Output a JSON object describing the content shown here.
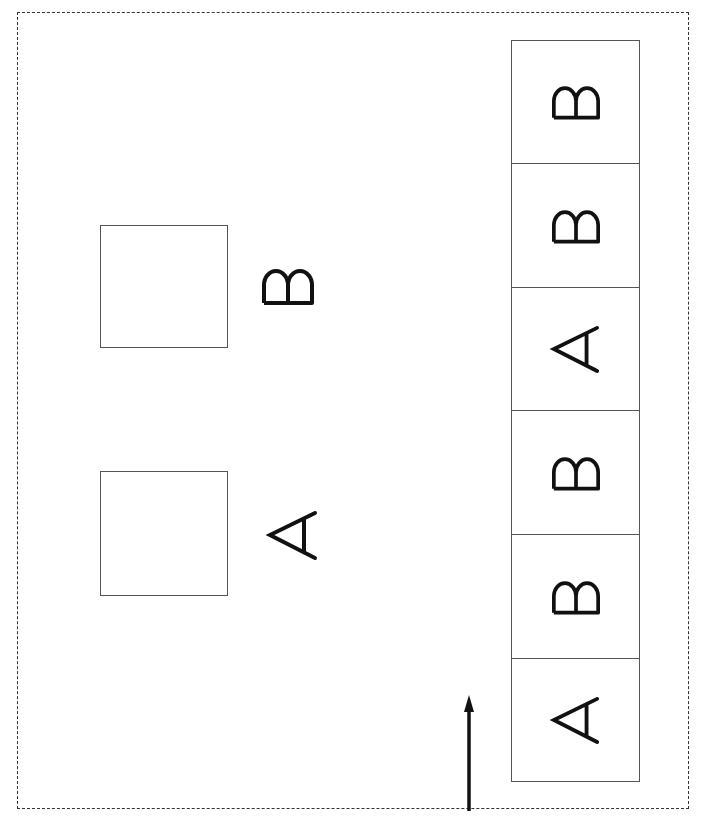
{
  "diagram": {
    "reference_items": [
      {
        "box": "empty",
        "label": "B"
      },
      {
        "box": "empty",
        "label": "A"
      }
    ],
    "stack": {
      "order_top_to_bottom": [
        "B",
        "B",
        "A",
        "B",
        "B",
        "A"
      ],
      "cells": [
        {
          "label": "B"
        },
        {
          "label": "B"
        },
        {
          "label": "A"
        },
        {
          "label": "B"
        },
        {
          "label": "B"
        },
        {
          "label": "A"
        }
      ]
    },
    "arrow": {
      "direction": "up",
      "icon": "arrow-up-icon"
    },
    "colors": {
      "line": "#555555",
      "ink": "#111111",
      "border": "#333333"
    }
  }
}
